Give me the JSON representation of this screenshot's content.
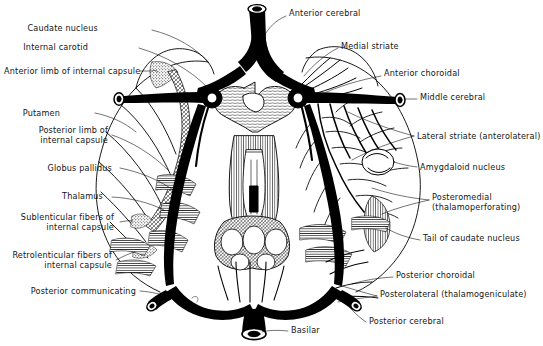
{
  "figure": {
    "background_color": "#ffffff",
    "ink_color": "#000000",
    "text_color": "#141414",
    "width": 543,
    "height": 346,
    "style": "pen-and-ink anatomical line drawing with leader lines",
    "signature": "artist signature"
  },
  "labels_left": [
    {
      "id": "caudate-nucleus",
      "text": "Caudate nucleus",
      "x": 98,
      "y": 28,
      "align": "right"
    },
    {
      "id": "internal-carotid",
      "text": "Internal carotid",
      "x": 88,
      "y": 47,
      "align": "right"
    },
    {
      "id": "anterior-limb-internal-capsule",
      "text": "Anterior limb of internal capsule",
      "x": 4,
      "y": 71,
      "align": "left"
    },
    {
      "id": "putamen",
      "text": "Putamen",
      "x": 60,
      "y": 113,
      "align": "right"
    },
    {
      "id": "posterior-limb-internal-capsule",
      "text": "Posterior limb of\ninternal capsule",
      "x": 28,
      "y": 130,
      "align": "right"
    },
    {
      "id": "globus-pallidus",
      "text": "Globus pallidus",
      "x": 44,
      "y": 168,
      "align": "right"
    },
    {
      "id": "thalamus",
      "text": "Thalamus",
      "x": 69,
      "y": 196,
      "align": "right"
    },
    {
      "id": "sublenticular-fibers",
      "text": "Sublenticular fibers of\ninternal capsule",
      "x": 12,
      "y": 217,
      "align": "right"
    },
    {
      "id": "retrolenticular-fibers",
      "text": "Retrolenticular fibers of\ninternal capsule",
      "x": 8,
      "y": 255,
      "align": "right"
    },
    {
      "id": "posterior-communicating",
      "text": "Posterior communicating",
      "x": 36,
      "y": 291,
      "align": "right"
    }
  ],
  "labels_right": [
    {
      "id": "anterior-cerebral",
      "text": "Anterior cerebral",
      "x": 289,
      "y": 12,
      "align": "left"
    },
    {
      "id": "medial-striate",
      "text": "Medial striate",
      "x": 341,
      "y": 45,
      "align": "left"
    },
    {
      "id": "anterior-choroidal",
      "text": "Anterior choroidal",
      "x": 384,
      "y": 72,
      "align": "left"
    },
    {
      "id": "middle-cerebral",
      "text": "Middle cerebral",
      "x": 420,
      "y": 95,
      "align": "left"
    },
    {
      "id": "lateral-striate",
      "text": "Lateral striate (anterolateral)",
      "x": 417,
      "y": 135,
      "align": "left"
    },
    {
      "id": "amygdaloid-nucleus",
      "text": "Amygdaloid nucleus",
      "x": 420,
      "y": 166,
      "align": "left"
    },
    {
      "id": "posteromedial",
      "text": "Posteromedial\n(thalamoperforating)",
      "x": 432,
      "y": 197,
      "align": "left"
    },
    {
      "id": "tail-of-caudate-nucleus",
      "text": "Tail of caudate nucleus",
      "x": 423,
      "y": 237,
      "align": "left"
    },
    {
      "id": "posterior-choroidal",
      "text": "Posterior choroidal",
      "x": 396,
      "y": 274,
      "align": "left"
    },
    {
      "id": "posterolateral",
      "text": "Posterolateral (thalamogeniculate)",
      "x": 380,
      "y": 293,
      "align": "left"
    },
    {
      "id": "posterior-cerebral",
      "text": "Posterior cerebral",
      "x": 369,
      "y": 320,
      "align": "left"
    }
  ],
  "labels_bottom": [
    {
      "id": "basilar",
      "text": "Basilar",
      "x": 291,
      "y": 329,
      "align": "left"
    }
  ],
  "anatomy": {
    "vessels": [
      "anterior cerebral artery",
      "internal carotid artery",
      "middle cerebral artery",
      "posterior communicating artery",
      "posterior cerebral artery",
      "basilar artery",
      "medial striate artery",
      "lateral striate (anterolateral) arteries",
      "anterior choroidal artery",
      "posterior choroidal artery",
      "posteromedial (thalamoperforating) arteries",
      "posterolateral (thalamogeniculate) arteries"
    ],
    "structures": [
      "caudate nucleus",
      "tail of caudate nucleus",
      "putamen",
      "globus pallidus",
      "thalamus",
      "amygdaloid nucleus",
      "anterior limb of internal capsule",
      "posterior limb of internal capsule",
      "sublenticular fibers of internal capsule",
      "retrolenticular fibers of internal capsule",
      "optic chiasm",
      "mammillary bodies",
      "midbrain"
    ]
  }
}
